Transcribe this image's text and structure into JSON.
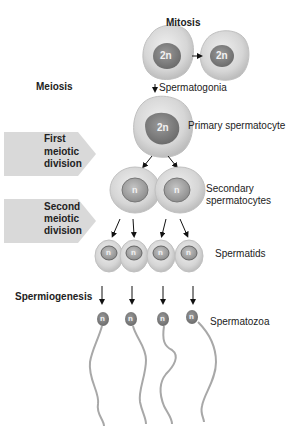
{
  "diagram": {
    "section_labels": {
      "mitosis": "Mitosis",
      "meiosis": "Meiosis",
      "spermiogenesis": "Spermiogenesis"
    },
    "stage_boxes": [
      {
        "lines": [
          "First",
          "meiotic",
          "division"
        ]
      },
      {
        "lines": [
          "Second",
          "meiotic",
          "division"
        ]
      }
    ],
    "cell_labels": {
      "spermatogonia": "Spermatogonia",
      "primary": "Primary spermatocyte",
      "secondary_1": "Secondary",
      "secondary_2": "spermatocytes",
      "spermatids": "Spermatids",
      "spermatozoa": "Spermatozoa"
    },
    "ploidy": {
      "diploid": "2n",
      "haploid": "n"
    },
    "colors": {
      "cell_fill": "#d8d8d8",
      "cell_edge": "#b8b8b8",
      "nucleus_dark": "#7a7a7a",
      "nucleus_mid": "#a0a0a0",
      "arrow_box": "#d9d9d9",
      "text": "#222222"
    }
  }
}
